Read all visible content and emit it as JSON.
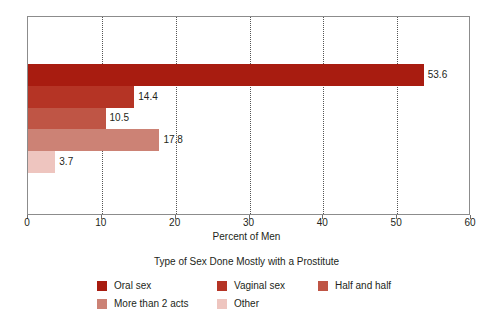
{
  "chart_data": {
    "type": "bar",
    "orientation": "horizontal",
    "title": "",
    "xlabel": "Percent of Men",
    "ylabel": "",
    "xlim": [
      0,
      60
    ],
    "ylim": null,
    "grid": "vertical-dotted",
    "xticks": [
      0,
      10,
      20,
      30,
      40,
      50,
      60
    ],
    "xticklabels": [
      "0",
      "10",
      "20",
      "30",
      "40",
      "50",
      "60"
    ],
    "categories": [
      "Oral sex",
      "Vaginal sex",
      "Half and half",
      "More than 2 acts",
      "Other"
    ],
    "values": [
      53.6,
      14.4,
      10.5,
      17.8,
      3.7
    ],
    "datalabels": [
      "53.6",
      "14.4",
      "10.5",
      "17.8",
      "3.7"
    ],
    "colors": [
      "#a81c10",
      "#b53425",
      "#bf5545",
      "#cc8275",
      "#eec5bf"
    ],
    "legend": {
      "title": "Type of Sex Done Mostly with a Prostitute",
      "position": "bottom",
      "columns": 3,
      "entries": [
        {
          "label": "Oral sex",
          "color": "#a81c10"
        },
        {
          "label": "Vaginal sex",
          "color": "#b53425"
        },
        {
          "label": "Half and half",
          "color": "#bf5545"
        },
        {
          "label": "More than 2 acts",
          "color": "#cc8275"
        },
        {
          "label": "Other",
          "color": "#eec5bf"
        }
      ]
    },
    "axis_color": "#8c8c8c",
    "background": "#ffffff"
  }
}
